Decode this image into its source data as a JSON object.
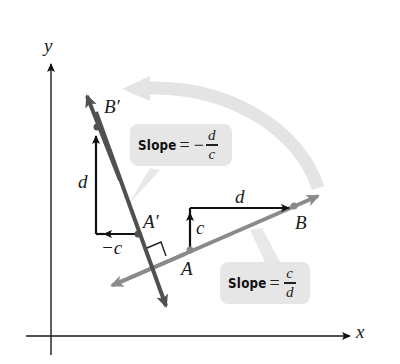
{
  "colors": {
    "axis": "#1a1a1a",
    "line_original": "#8a8a8a",
    "line_rotated": "#505050",
    "vector": "#111111",
    "rotation_arrow": "#e4e4e4",
    "callout_bg": "#e6e6e6"
  },
  "axes": {
    "x_label": "x",
    "y_label": "y"
  },
  "points": {
    "A": "A",
    "B": "B",
    "A_prime": "A′",
    "B_prime": "B′"
  },
  "original_line": {
    "run_label": "d",
    "rise_label": "c",
    "slope_callout": {
      "word": "Slope",
      "equals": "=",
      "numerator": "c",
      "denominator": "d"
    }
  },
  "rotated_line": {
    "run_label": "−c",
    "rise_label": "d",
    "slope_callout": {
      "word": "Slope",
      "equals": "=",
      "sign": "−",
      "numerator": "d",
      "denominator": "c"
    }
  },
  "annotations": {
    "right_angle_marker": true,
    "rotation_arrow": "counterclockwise 90° rotation"
  }
}
